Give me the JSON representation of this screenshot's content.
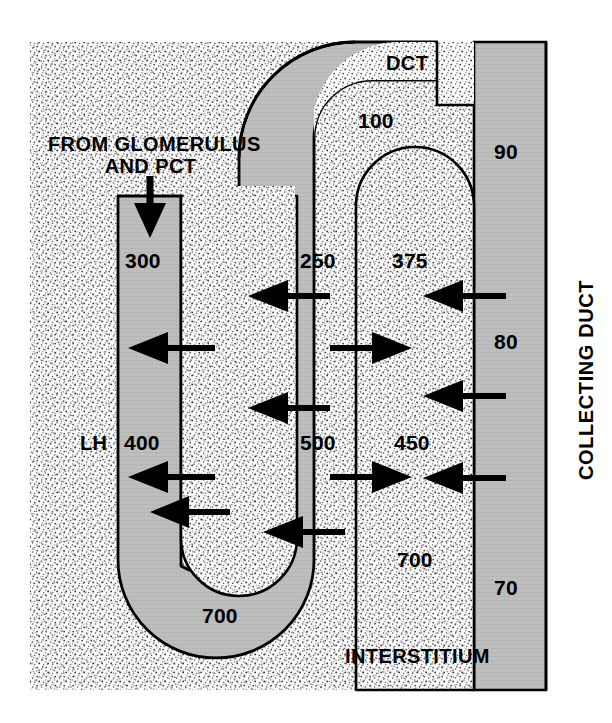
{
  "figure": {
    "type": "anatomical-diagram",
    "background_color": "#ffffff",
    "interstitium_fill": "#f2f2f2",
    "tubule_fill": "#bdbdbd",
    "stroke_color": "#000000"
  },
  "labels": {
    "from_glomerulus_line1": "FROM GLOMERULUS",
    "from_glomerulus_line2": "AND PCT",
    "dct": "DCT",
    "lh": "LH",
    "interstitium": "INTERSTITIUM",
    "collecting_duct": "COLLECTING DUCT"
  },
  "osmolality_values": {
    "descending_limb_top": "300",
    "descending_limb_mid": "400",
    "loop_bend": "700",
    "ascending_limb_top": "250",
    "ascending_limb_mid": "500",
    "dct_outflow": "100",
    "interstitium_upper": "375",
    "interstitium_mid": "450",
    "interstitium_lower": "700",
    "collecting_duct_top": "90",
    "collecting_duct_mid": "80",
    "collecting_duct_bottom": "70"
  },
  "arrows": [
    {
      "name": "inflow-from-glomerulus",
      "direction": "down",
      "target": "descending-limb"
    },
    {
      "name": "water-out-descending-upper",
      "direction": "left",
      "target": "descending-limb"
    },
    {
      "name": "water-out-descending-mid",
      "direction": "left",
      "target": "descending-limb"
    },
    {
      "name": "water-out-descending-lower",
      "direction": "left",
      "target": "descending-limb"
    },
    {
      "name": "solute-out-ascending-upper",
      "direction": "left",
      "target": "ascending-limb"
    },
    {
      "name": "solute-out-ascending-mid",
      "direction": "left",
      "target": "ascending-limb"
    },
    {
      "name": "solute-out-ascending-lower",
      "direction": "left",
      "target": "ascending-limb"
    },
    {
      "name": "water-out-collecting-duct-upper",
      "direction": "left",
      "target": "interstitium"
    },
    {
      "name": "water-out-collecting-duct-mid",
      "direction": "left",
      "target": "interstitium"
    },
    {
      "name": "water-out-collecting-duct-lower",
      "direction": "left",
      "target": "interstitium"
    },
    {
      "name": "solute-into-interstitium-upper",
      "direction": "right",
      "target": "interstitium"
    },
    {
      "name": "solute-into-interstitium-lower",
      "direction": "right",
      "target": "interstitium"
    }
  ]
}
